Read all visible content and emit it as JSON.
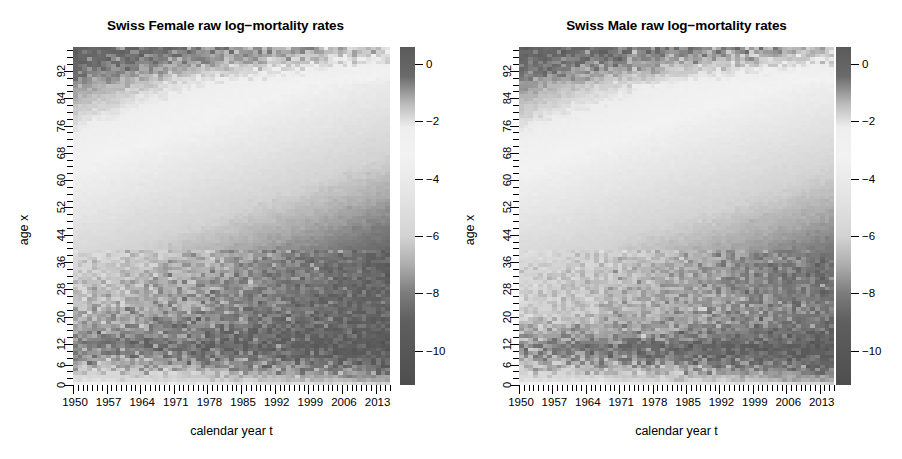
{
  "figure": {
    "width": 902,
    "height": 459,
    "background": "#ffffff",
    "foreground": "#000000"
  },
  "chart_data": [
    {
      "type": "heatmap",
      "panel": "left",
      "title": "Swiss Female raw log-mortality rates",
      "xlabel": "calendar year t",
      "ylabel": "age x",
      "xlim": [
        1950,
        2016
      ],
      "ylim": [
        0,
        99
      ],
      "xticks": [
        1950,
        1957,
        1964,
        1971,
        1978,
        1985,
        1992,
        1999,
        2006,
        2013
      ],
      "xticklabels": [
        "1950",
        "1957",
        "1964",
        "1971",
        "1978",
        "1985",
        "1992",
        "1999",
        "2006",
        "2013"
      ],
      "x_minor_tick_step": 1,
      "yticks": [
        0,
        6,
        12,
        20,
        28,
        36,
        44,
        52,
        60,
        68,
        76,
        84,
        92
      ],
      "yticklabels": [
        "0",
        "6",
        "12",
        "20",
        "28",
        "36",
        "44",
        "52",
        "60",
        "68",
        "76",
        "84",
        "92"
      ],
      "y_minor_tick_step": 2,
      "grid": false,
      "colorbar": {
        "label": "",
        "ticks": [
          0,
          -2,
          -4,
          -6,
          -8,
          -10
        ],
        "ticklabels": [
          "0",
          "-2",
          "-4",
          "-6",
          "-8",
          "-10"
        ],
        "vmin": -11.2,
        "vmax": 0.6,
        "position": "right",
        "colormap_stops": [
          {
            "value": 0.6,
            "color": "#5a5a5a"
          },
          {
            "value": -0.4,
            "color": "#6a6a6a"
          },
          {
            "value": -1.4,
            "color": "#bdbdbd"
          },
          {
            "value": -2.2,
            "color": "#eeeeee"
          },
          {
            "value": -3.2,
            "color": "#f2f2f2"
          },
          {
            "value": -4.6,
            "color": "#e4e4e4"
          },
          {
            "value": -6.0,
            "color": "#d3d3d3"
          },
          {
            "value": -7.0,
            "color": "#aeaeae"
          },
          {
            "value": -8.0,
            "color": "#7c7c7c"
          },
          {
            "value": -9.0,
            "color": "#5f5f5f"
          },
          {
            "value": -11.2,
            "color": "#4e4e4e"
          }
        ]
      },
      "surface_model": {
        "description": "log mortality mu(x,t) for Swiss females, 1950-2016, ages 0-99",
        "infant_log_mu_1950": -3.5,
        "infant_log_mu_2016": -6.1,
        "accident_hump_age": 20,
        "accident_hump_strength": 0.45,
        "min_log_mu_age_1950": 12,
        "min_log_mu_1950": -8.0,
        "min_log_mu_2016": -9.6,
        "old_age_slope": 0.093,
        "old_age_log_mu_at_99": -0.15,
        "noise_sigma_young": 0.46,
        "noise_sigma_old": 0.085,
        "improvement_per_year_mid": 0.024,
        "seed": 20160101
      }
    },
    {
      "type": "heatmap",
      "panel": "right",
      "title": "Swiss Male raw log-mortality rates",
      "xlabel": "calendar year t",
      "ylabel": "age x",
      "xlim": [
        1950,
        2016
      ],
      "ylim": [
        0,
        99
      ],
      "xticks": [
        1950,
        1957,
        1964,
        1971,
        1978,
        1985,
        1992,
        1999,
        2006,
        2013
      ],
      "xticklabels": [
        "1950",
        "1957",
        "1964",
        "1971",
        "1978",
        "1985",
        "1992",
        "1999",
        "2006",
        "2013"
      ],
      "x_minor_tick_step": 1,
      "yticks": [
        0,
        6,
        12,
        20,
        28,
        36,
        44,
        52,
        60,
        68,
        76,
        84,
        92
      ],
      "yticklabels": [
        "0",
        "6",
        "12",
        "20",
        "28",
        "36",
        "44",
        "52",
        "60",
        "68",
        "76",
        "84",
        "92"
      ],
      "y_minor_tick_step": 2,
      "grid": false,
      "colorbar": {
        "label": "",
        "ticks": [
          0,
          -2,
          -4,
          -6,
          -8,
          -10
        ],
        "ticklabels": [
          "0",
          "-2",
          "-4",
          "-6",
          "-8",
          "-10"
        ],
        "vmin": -11.2,
        "vmax": 0.6,
        "position": "right",
        "colormap_stops": [
          {
            "value": 0.6,
            "color": "#5a5a5a"
          },
          {
            "value": -0.4,
            "color": "#6a6a6a"
          },
          {
            "value": -1.4,
            "color": "#bdbdbd"
          },
          {
            "value": -2.2,
            "color": "#eeeeee"
          },
          {
            "value": -3.2,
            "color": "#f2f2f2"
          },
          {
            "value": -4.6,
            "color": "#e4e4e4"
          },
          {
            "value": -6.0,
            "color": "#d3d3d3"
          },
          {
            "value": -7.0,
            "color": "#aeaeae"
          },
          {
            "value": -8.0,
            "color": "#7c7c7c"
          },
          {
            "value": -9.0,
            "color": "#5f5f5f"
          },
          {
            "value": -11.2,
            "color": "#4e4e4e"
          }
        ]
      },
      "surface_model": {
        "description": "log mortality mu(x,t) for Swiss males, 1950-2016, ages 0-99",
        "infant_log_mu_1950": -3.25,
        "infant_log_mu_2016": -5.9,
        "accident_hump_age": 20,
        "accident_hump_strength": 0.95,
        "min_log_mu_age_1950": 11,
        "min_log_mu_1950": -7.9,
        "min_log_mu_2016": -9.5,
        "old_age_slope": 0.09,
        "old_age_log_mu_at_99": -0.1,
        "noise_sigma_young": 0.4,
        "noise_sigma_old": 0.08,
        "improvement_per_year_mid": 0.018,
        "seed": 771133
      }
    }
  ]
}
